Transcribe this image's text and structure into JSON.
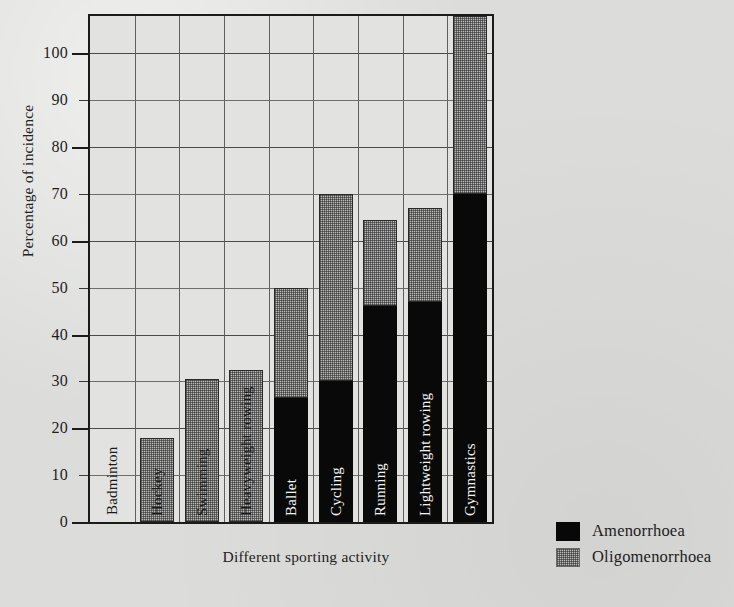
{
  "chart_data": {
    "type": "bar",
    "stacked": true,
    "title": "",
    "xlabel": "Different sporting activity",
    "ylabel": "Percentage of incidence",
    "ylim": [
      0,
      108
    ],
    "grid": true,
    "ytick_labels": [
      "0",
      "10",
      "20",
      "30",
      "40",
      "50",
      "60",
      "70",
      "80",
      "90",
      "100"
    ],
    "ytick_values": [
      0,
      10,
      20,
      30,
      40,
      50,
      60,
      70,
      80,
      90,
      100
    ],
    "ytick_major": [
      0,
      20,
      40,
      60,
      80,
      100
    ],
    "categories": [
      "Badminton",
      "Hockey",
      "Swimming",
      "Heavyweight rowing",
      "Ballet",
      "Cycling",
      "Running",
      "Lightweight rowing",
      "Gymnastics"
    ],
    "series": [
      {
        "name": "Amenorrhoea",
        "color": "#080808",
        "values": [
          0,
          0,
          0,
          0,
          26.5,
          30,
          46,
          47,
          70
        ]
      },
      {
        "name": "Oligomenorrhoea",
        "color": "#b9b9b7",
        "values": [
          0,
          18,
          30.5,
          32.5,
          23.5,
          40,
          18.5,
          20,
          38
        ]
      }
    ],
    "totals": [
      0,
      18,
      30.5,
      32.5,
      50,
      70,
      64.5,
      67,
      108
    ]
  },
  "legend": {
    "position": "bottom-right",
    "entries": [
      {
        "label": "Amenorrhoea",
        "swatch": "solid-black"
      },
      {
        "label": "Oligomenorrhoea",
        "swatch": "stippled-grey"
      }
    ]
  }
}
